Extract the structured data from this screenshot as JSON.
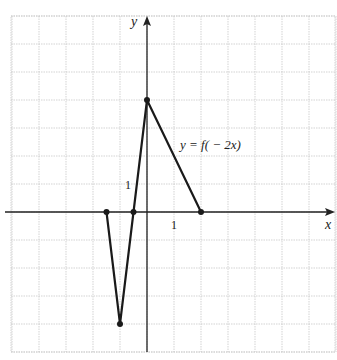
{
  "chart_data": {
    "type": "line",
    "title": "",
    "function_label": "y = f( − 2x)",
    "xlabel": "x",
    "ylabel": "y",
    "tick_labels": {
      "x_unit": "1",
      "y_unit": "1"
    },
    "x": [
      -1.5,
      -1,
      -0.5,
      0,
      2
    ],
    "y": [
      0,
      -4,
      0,
      4,
      0
    ],
    "points": [
      {
        "x": -1.5,
        "y": 0
      },
      {
        "x": -1,
        "y": -4
      },
      {
        "x": -0.5,
        "y": 0
      },
      {
        "x": 0,
        "y": 4
      },
      {
        "x": 2,
        "y": 0
      }
    ],
    "xlim": [
      -5,
      7
    ],
    "ylim": [
      -5,
      7
    ],
    "grid": true,
    "grid_style": "dotted",
    "legend": null
  },
  "colors": {
    "grid": "#c8c8c8",
    "axes": "#222222",
    "curve": "#1a1a1a",
    "background": "#ffffff"
  }
}
